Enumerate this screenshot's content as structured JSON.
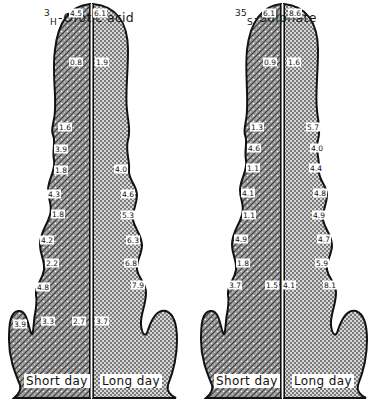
{
  "panels": [
    {
      "id": "orotic",
      "title_sup": "3",
      "title_sub": "H",
      "title_rest": "-Orotic acid",
      "short_day_label": "Short day",
      "long_day_label": "Long day",
      "short_day_values": [
        {
          "v": "4.5",
          "x": 76,
          "y": 13
        },
        {
          "v": "0.8",
          "x": 76,
          "y": 62
        },
        {
          "v": "1.6",
          "x": 65,
          "y": 127
        },
        {
          "v": "3.9",
          "x": 61,
          "y": 149
        },
        {
          "v": "1.8",
          "x": 61,
          "y": 170
        },
        {
          "v": "4.3",
          "x": 54,
          "y": 194
        },
        {
          "v": "1.8",
          "x": 58,
          "y": 214
        },
        {
          "v": "4.2",
          "x": 47,
          "y": 240
        },
        {
          "v": "2.2",
          "x": 52,
          "y": 263
        },
        {
          "v": "4.8",
          "x": 43,
          "y": 287
        },
        {
          "v": "3.9",
          "x": 20,
          "y": 324
        },
        {
          "v": "3.3",
          "x": 48,
          "y": 321
        },
        {
          "v": "2.7",
          "x": 79,
          "y": 321
        }
      ],
      "long_day_values": [
        {
          "v": "6.1",
          "x": 100,
          "y": 13
        },
        {
          "v": "1.9",
          "x": 102,
          "y": 62
        },
        {
          "v": "4.0",
          "x": 121,
          "y": 169
        },
        {
          "v": "4.6",
          "x": 128,
          "y": 194
        },
        {
          "v": "5.3",
          "x": 128,
          "y": 215
        },
        {
          "v": "6.3",
          "x": 133,
          "y": 240
        },
        {
          "v": "6.8",
          "x": 131,
          "y": 263
        },
        {
          "v": "7.9",
          "x": 138,
          "y": 285
        },
        {
          "v": "3.7",
          "x": 102,
          "y": 321
        }
      ]
    },
    {
      "id": "sulphate",
      "title_sup": "35",
      "title_sub": "S",
      "title_rest": "-Sulphate",
      "short_day_label": "Short day",
      "long_day_label": "Long day",
      "short_day_values": [
        {
          "v": "6.1",
          "x": 269,
          "y": 13
        },
        {
          "v": "0.9",
          "x": 270,
          "y": 62
        },
        {
          "v": "1.3",
          "x": 257,
          "y": 127
        },
        {
          "v": "4.6",
          "x": 254,
          "y": 148
        },
        {
          "v": "1.1",
          "x": 253,
          "y": 168
        },
        {
          "v": "4.1",
          "x": 248,
          "y": 193
        },
        {
          "v": "1.1",
          "x": 249,
          "y": 215
        },
        {
          "v": "4.9",
          "x": 241,
          "y": 239
        },
        {
          "v": "1.8",
          "x": 243,
          "y": 263
        },
        {
          "v": "3.7",
          "x": 235,
          "y": 285
        },
        {
          "v": "1.5",
          "x": 272,
          "y": 285
        }
      ],
      "long_day_values": [
        {
          "v": "8.6",
          "x": 295,
          "y": 13
        },
        {
          "v": "1.6",
          "x": 294,
          "y": 62
        },
        {
          "v": "5.7",
          "x": 313,
          "y": 127
        },
        {
          "v": "4.0",
          "x": 317,
          "y": 148
        },
        {
          "v": "4.4",
          "x": 316,
          "y": 168
        },
        {
          "v": "4.8",
          "x": 320,
          "y": 193
        },
        {
          "v": "4.9",
          "x": 319,
          "y": 215
        },
        {
          "v": "4.7",
          "x": 324,
          "y": 239
        },
        {
          "v": "5.9",
          "x": 322,
          "y": 263
        },
        {
          "v": "8.1",
          "x": 330,
          "y": 285
        },
        {
          "v": "4.1",
          "x": 289,
          "y": 285
        }
      ]
    }
  ]
}
